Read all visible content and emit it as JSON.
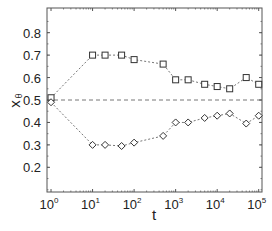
{
  "chart_data": {
    "type": "line",
    "title": "",
    "xlabel": "t",
    "ylabel": "x",
    "ylabel_subscript": "θ",
    "xscale": "log",
    "xlim": [
      0.8,
      120000
    ],
    "ylim": [
      0.09,
      0.91
    ],
    "xticks": [
      1,
      10,
      100,
      1000,
      10000,
      100000
    ],
    "xtick_labels": [
      {
        "base": "10",
        "exp": "0"
      },
      {
        "base": "10",
        "exp": "1"
      },
      {
        "base": "10",
        "exp": "2"
      },
      {
        "base": "10",
        "exp": "3"
      },
      {
        "base": "10",
        "exp": "4"
      },
      {
        "base": "10",
        "exp": "5"
      }
    ],
    "yticks": [
      0.2,
      0.3,
      0.4,
      0.5,
      0.6,
      0.7,
      0.8
    ],
    "ytick_labels": [
      "0.2",
      "0.3",
      "0.4",
      "0.5",
      "0.6",
      "0.7",
      "0.8"
    ],
    "grid": false,
    "legend": null,
    "reference_line": {
      "y": 0.5,
      "style": "dashed"
    },
    "series": [
      {
        "name": "upper (squares)",
        "marker": "square",
        "linestyle": "dotted",
        "x": [
          1,
          10,
          20,
          50,
          100,
          500,
          1000,
          2000,
          5000,
          10000,
          20000,
          50000,
          100000
        ],
        "values": [
          0.51,
          0.7,
          0.7,
          0.7,
          0.68,
          0.66,
          0.59,
          0.59,
          0.57,
          0.56,
          0.55,
          0.6,
          0.57
        ]
      },
      {
        "name": "lower (diamonds)",
        "marker": "diamond",
        "linestyle": "dotted",
        "x": [
          1,
          10,
          20,
          50,
          100,
          500,
          1000,
          2000,
          5000,
          10000,
          20000,
          50000,
          100000
        ],
        "values": [
          0.49,
          0.3,
          0.3,
          0.295,
          0.31,
          0.34,
          0.4,
          0.4,
          0.42,
          0.43,
          0.44,
          0.395,
          0.43
        ]
      }
    ]
  },
  "colors": {
    "axis": "#555555",
    "line": "#666666",
    "marker_stroke": "#333333",
    "text": "#222222"
  }
}
